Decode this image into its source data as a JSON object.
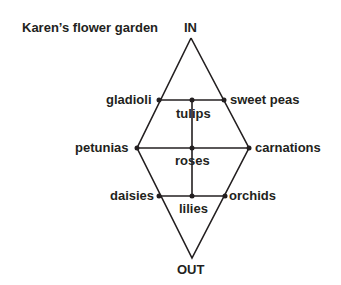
{
  "title": "Karen’s flower garden",
  "entry_label": "IN",
  "exit_label": "OUT",
  "nodes": {
    "gladioli": "gladioli",
    "sweet_peas": "sweet peas",
    "tulips": "tulips",
    "petunias": "petunias",
    "carnations": "carnations",
    "roses": "roses",
    "daisies": "daisies",
    "orchids": "orchids",
    "lilies": "lilies"
  },
  "colors": {
    "line": "#231f20",
    "text": "#231f20",
    "background": "#ffffff"
  }
}
